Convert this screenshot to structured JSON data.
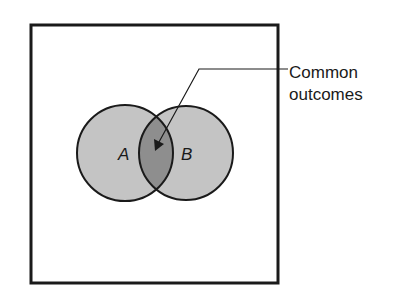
{
  "diagram": {
    "type": "venn",
    "sets": [
      {
        "label": "A",
        "fill": "#c4c4c4"
      },
      {
        "label": "B",
        "fill": "#c4c4c4"
      }
    ],
    "intersection_fill": "#8e8e8e",
    "annotation": {
      "line1": "Common",
      "line2": "outcomes"
    },
    "colors": {
      "stroke": "#1a1a1a",
      "background": "#ffffff"
    }
  }
}
